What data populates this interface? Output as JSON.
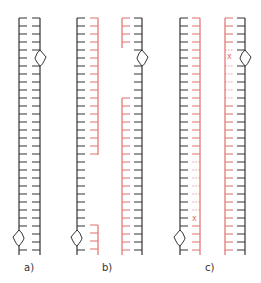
{
  "figure": {
    "panels": [
      {
        "id": "a",
        "label": "a)",
        "label_x": 24,
        "label_y": 262
      },
      {
        "id": "b",
        "label": "b)",
        "label_x": 102,
        "label_y": 262
      },
      {
        "id": "c",
        "label": "c)",
        "label_x": 205,
        "label_y": 262
      }
    ],
    "colors": {
      "parental_strand": "#333333",
      "new_strand": "#e0706a",
      "background": "#ffffff"
    },
    "strands": [
      {
        "panel": "a",
        "x": 19,
        "side": "right",
        "color": "parental_strand",
        "segments": [
          [
            18,
            255
          ]
        ],
        "loop_at": 238,
        "loop_dir": "left"
      },
      {
        "panel": "a",
        "x": 40,
        "side": "left",
        "color": "parental_strand",
        "segments": [
          [
            18,
            255
          ]
        ],
        "loop_at": 58,
        "loop_dir": "right"
      },
      {
        "panel": "b",
        "x": 77,
        "side": "right",
        "color": "parental_strand",
        "segments": [
          [
            18,
            255
          ]
        ],
        "loop_at": 238,
        "loop_dir": "left"
      },
      {
        "panel": "b",
        "x": 98,
        "side": "left",
        "color": "new_strand",
        "segments": [
          [
            18,
            155
          ],
          [
            225,
            255
          ]
        ]
      },
      {
        "panel": "b",
        "x": 122,
        "side": "right",
        "color": "new_strand",
        "segments": [
          [
            18,
            48
          ],
          [
            98,
            255
          ]
        ]
      },
      {
        "panel": "b",
        "x": 142,
        "side": "left",
        "color": "parental_strand",
        "segments": [
          [
            18,
            255
          ]
        ],
        "loop_at": 58,
        "loop_dir": "right"
      },
      {
        "panel": "c",
        "x": 180,
        "side": "right",
        "color": "parental_strand",
        "segments": [
          [
            18,
            255
          ]
        ],
        "loop_at": 238,
        "loop_dir": "left"
      },
      {
        "panel": "c",
        "x": 200,
        "side": "left",
        "color": "new_strand",
        "segments": [
          [
            18,
            255
          ]
        ],
        "dotted": [
          [
            155,
            225
          ]
        ],
        "mark_x_at": 218
      },
      {
        "panel": "c",
        "x": 225,
        "side": "right",
        "color": "new_strand",
        "segments": [
          [
            18,
            255
          ]
        ],
        "dotted": [
          [
            48,
            98
          ]
        ],
        "mark_x_at": 56
      },
      {
        "panel": "c",
        "x": 245,
        "side": "left",
        "color": "parental_strand",
        "segments": [
          [
            18,
            255
          ]
        ],
        "loop_at": 58,
        "loop_dir": "right"
      }
    ],
    "tick_spacing": 8,
    "tick_length": 8,
    "mismatch_marker": "x"
  }
}
